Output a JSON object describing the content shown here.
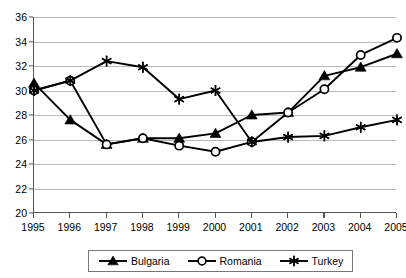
{
  "chart_data": {
    "type": "line",
    "title": "",
    "subtitle": "",
    "xlabel": "",
    "ylabel": "",
    "xlim": [
      1995,
      2005
    ],
    "ylim": [
      20,
      36
    ],
    "ytick_step": 2,
    "grid": true,
    "legend_position": "bottom",
    "x": [
      1995,
      1996,
      1997,
      1998,
      1999,
      2000,
      2001,
      2002,
      2003,
      2004,
      2005
    ],
    "categories": [
      "1995",
      "1996",
      "1997",
      "1998",
      "1999",
      "2000",
      "2001",
      "2002",
      "2003",
      "2004",
      "2005"
    ],
    "yticks": [
      20,
      22,
      24,
      26,
      28,
      30,
      32,
      34,
      36
    ],
    "ytick_labels": [
      "20",
      "22",
      "24",
      "26",
      "28",
      "30",
      "32",
      "34",
      "36"
    ],
    "series": [
      {
        "name": "Bulgaria",
        "marker": "triangle",
        "color": "#000000",
        "values": [
          30.6,
          27.6,
          25.6,
          26.1,
          26.1,
          26.5,
          28.0,
          28.2,
          31.2,
          31.9,
          33.0
        ]
      },
      {
        "name": "Romania",
        "marker": "circle-open",
        "color": "#000000",
        "values": [
          30.0,
          30.8,
          25.6,
          26.1,
          25.5,
          25.0,
          25.8,
          28.2,
          30.1,
          32.9,
          34.3
        ]
      },
      {
        "name": "Turkey",
        "marker": "asterisk",
        "color": "#000000",
        "values": [
          30.0,
          30.8,
          32.4,
          31.9,
          29.3,
          30.0,
          25.8,
          26.2,
          26.3,
          27.0,
          27.6
        ]
      }
    ]
  },
  "legend": {
    "items": [
      {
        "label": "Bulgaria",
        "marker": "triangle"
      },
      {
        "label": "Romania",
        "marker": "circle-open"
      },
      {
        "label": "Turkey",
        "marker": "asterisk"
      }
    ]
  }
}
